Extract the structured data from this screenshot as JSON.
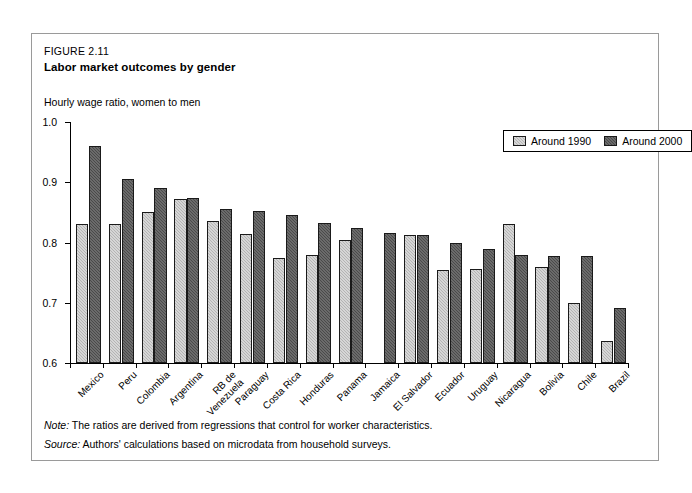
{
  "figure": {
    "number": "FIGURE 2.11",
    "title": "Labor market outcomes by gender",
    "note_lead": "Note:",
    "note_text": "The ratios are derived from regressions that control for worker characteristics.",
    "source_lead": "Source:",
    "source_text": "Authors' calculations based on microdata from household surveys."
  },
  "legend": {
    "series1_label": "Around 1990",
    "series2_label": "Around 2000",
    "series1_color": "#b4b4b4",
    "series2_color": "#4a4a4a"
  },
  "chart_data": {
    "type": "bar",
    "title": "Labor market outcomes by gender",
    "subtitle": "FIGURE 2.11",
    "ylabel": "Hourly wage ratio, women to men",
    "xlabel": "",
    "ylim": [
      0.6,
      1.0
    ],
    "yticks": [
      0.6,
      0.7,
      0.8,
      0.9,
      1.0
    ],
    "ytick_labels": [
      "0.6",
      "0.7",
      "0.8",
      "0.9",
      "1.0"
    ],
    "grid": false,
    "legend_position": "top-right",
    "categories": [
      "Mexico",
      "Peru",
      "Colombia",
      "Argentina",
      "RB de Venezuela",
      "Paraguay",
      "Costa Rica",
      "Honduras",
      "Panama",
      "Jamaica",
      "El Salvador",
      "Ecuador",
      "Uruguay",
      "Nicaragua",
      "Bolivia",
      "Chile",
      "Brazil"
    ],
    "category_lines": [
      [
        "Mexico"
      ],
      [
        "Peru"
      ],
      [
        "Colombia"
      ],
      [
        "Argentina"
      ],
      [
        "RB de",
        "Venezuela"
      ],
      [
        "Paraguay"
      ],
      [
        "Costa Rica"
      ],
      [
        "Honduras"
      ],
      [
        "Panama"
      ],
      [
        "Jamaica"
      ],
      [
        "El Salvador"
      ],
      [
        "Ecuador"
      ],
      [
        "Uruguay"
      ],
      [
        "Nicaragua"
      ],
      [
        "Bolivia"
      ],
      [
        "Chile"
      ],
      [
        "Brazil"
      ]
    ],
    "series": [
      {
        "name": "Around 1990",
        "color": "#b4b4b4",
        "values": [
          0.83,
          0.83,
          0.85,
          0.872,
          0.835,
          0.814,
          0.774,
          0.78,
          0.805,
          null,
          0.812,
          0.755,
          0.756,
          0.83,
          0.76,
          0.7,
          0.636
        ]
      },
      {
        "name": "Around 2000",
        "color": "#4a4a4a",
        "values": [
          0.96,
          0.905,
          0.89,
          0.874,
          0.856,
          0.853,
          0.846,
          0.833,
          0.824,
          0.815,
          0.812,
          0.799,
          0.789,
          0.78,
          0.777,
          0.778,
          0.691
        ]
      }
    ]
  }
}
